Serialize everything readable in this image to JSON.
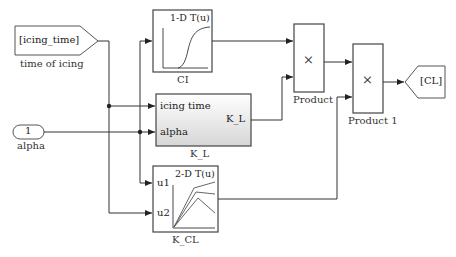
{
  "diagram": {
    "blocks": {
      "from_icing": {
        "text": "[icing_time]",
        "label": "time of icing"
      },
      "inport_alpha": {
        "text": "1",
        "label": "alpha"
      },
      "ci": {
        "title": "1-D T(u)",
        "label": "CI"
      },
      "k_l": {
        "in1": "icing time",
        "in2": "alpha",
        "out": "K_L",
        "label": "K_L"
      },
      "k_cl": {
        "title": "2-D T(u)",
        "in1": "u1",
        "in2": "u2",
        "label": "K_CL"
      },
      "product": {
        "symbol": "×",
        "label": "Product"
      },
      "product1": {
        "symbol": "×",
        "label": "Product 1"
      },
      "goto_cl": {
        "text": "[CL]"
      }
    },
    "colors": {
      "line": "#333333",
      "block_border": "#444444",
      "subsystem_fill_top": "#ffffff",
      "subsystem_fill_bottom": "#d9d9d9"
    }
  }
}
